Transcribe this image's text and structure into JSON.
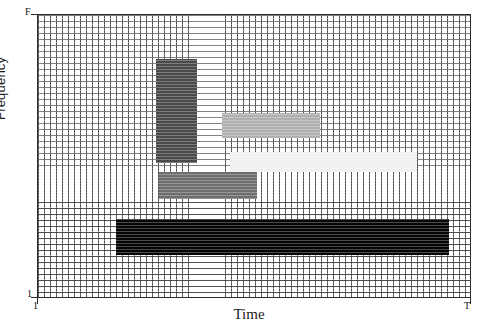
{
  "chart_data": {
    "type": "heatmap",
    "title": "",
    "xlabel": "Time",
    "ylabel": "Frequency",
    "xticklabels": [
      "1",
      "T"
    ],
    "yticklabels": [
      "1",
      "F"
    ],
    "xlim": [
      0,
      1
    ],
    "ylim": [
      0,
      1
    ],
    "grid": true,
    "legend": "none",
    "colorscale": "grayscale",
    "tiles": [
      {
        "name": "tile-dark-narrowband",
        "x0": 0.272,
        "x1": 0.369,
        "y0": 0.475,
        "y1": 0.845,
        "color": "#4a4a4a",
        "intensity": 0.71
      },
      {
        "name": "tile-midgray-midband",
        "x0": 0.426,
        "x1": 0.652,
        "y0": 0.563,
        "y1": 0.651,
        "color": "#b0b0b0",
        "intensity": 0.31
      },
      {
        "name": "tile-palest-wideband",
        "x0": 0.445,
        "x1": 0.878,
        "y0": 0.444,
        "y1": 0.514,
        "color": "#f0f0f0",
        "intensity": 0.06
      },
      {
        "name": "tile-gray-lowband",
        "x0": 0.279,
        "x1": 0.507,
        "y0": 0.349,
        "y1": 0.444,
        "color": "#6e6e6e",
        "intensity": 0.57
      },
      {
        "name": "tile-black-broadband",
        "x0": 0.18,
        "x1": 0.952,
        "y0": 0.148,
        "y1": 0.275,
        "color": "#050505",
        "intensity": 1.0
      }
    ]
  },
  "axes": {
    "ylabel": "Frequency",
    "xlabel": "Time",
    "y_top_tick": "F",
    "y_bottom_tick": "1",
    "x_left_tick": "1",
    "x_right_tick": "T"
  }
}
